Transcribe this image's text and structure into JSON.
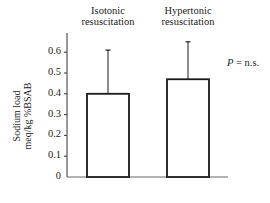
{
  "chart_data": {
    "type": "bar",
    "title": "",
    "categories": [
      "Isotonic resuscitation",
      "Hypertonic resuscitation"
    ],
    "category_lines": [
      [
        "Isotonic",
        "resuscitation"
      ],
      [
        "Hypertonic",
        "resuscitation"
      ]
    ],
    "values": [
      0.4,
      0.47
    ],
    "error_upper": [
      0.61,
      0.65
    ],
    "xlabel": "",
    "ylabel_lines": [
      "Sodium load",
      "meq/kg %BSAB"
    ],
    "ylabel": "Sodium load meq/kg %BSAB",
    "ylim": [
      0,
      0.68
    ],
    "yticks": [
      0,
      0.1,
      0.2,
      0.3,
      0.4,
      0.5,
      0.6
    ],
    "ytick_labels": [
      "0",
      "0.1",
      "0.2",
      "0.3",
      "0.4",
      "0.5",
      "0.6"
    ],
    "annotation": {
      "prefix": "P",
      "text": " = n.s."
    },
    "grid": false,
    "legend": null,
    "colors": {
      "bar_fill": "#ffffff",
      "bar_stroke": "#1a1a1a",
      "axis": "#333333"
    }
  }
}
